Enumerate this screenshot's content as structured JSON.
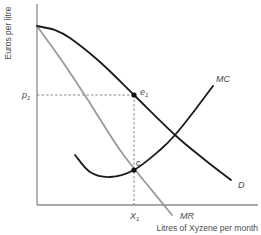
{
  "chart_data": {
    "type": "line",
    "title": "",
    "xlabel": "Litres of Xyzene per month",
    "ylabel": "Euros per litre",
    "grid": false,
    "legend": "none (curve labels placed at line ends)",
    "series": [
      {
        "name": "D",
        "description": "Demand curve (dark, concave then convex, downward sloping)",
        "color": "#1a1a1a",
        "points_px": [
          [
            37,
            26
          ],
          [
            55,
            30
          ],
          [
            70,
            38
          ],
          [
            100,
            62
          ],
          [
            134,
            95
          ],
          [
            175,
            135
          ],
          [
            205,
            160
          ],
          [
            231,
            180
          ]
        ]
      },
      {
        "name": "MR",
        "description": "Marginal revenue curve (grey, steeper downward slope, ends below x-axis)",
        "color": "#9a9a9a",
        "points_px": [
          [
            37,
            26
          ],
          [
            60,
            58
          ],
          [
            86,
            97
          ],
          [
            120,
            150
          ],
          [
            150,
            188
          ],
          [
            172,
            215
          ]
        ]
      },
      {
        "name": "MC",
        "description": "Marginal cost curve (dark, U-shaped)",
        "color": "#1a1a1a",
        "points_px": [
          [
            75,
            155
          ],
          [
            90,
            172
          ],
          [
            110,
            177
          ],
          [
            134,
            170
          ],
          [
            160,
            150
          ],
          [
            175,
            135
          ],
          [
            195,
            110
          ],
          [
            213,
            86
          ]
        ]
      }
    ],
    "points": [
      {
        "name": "e1",
        "label": "e",
        "subscript": "1",
        "px": [
          134,
          95
        ],
        "description": "Intersection of p1 with D at X1"
      },
      {
        "name": "c",
        "label": "c",
        "px": [
          134,
          170
        ],
        "description": "MR = MC intersection"
      }
    ],
    "guides": [
      {
        "type": "horizontal-dashed",
        "from_px": [
          37,
          95
        ],
        "to_px": [
          134,
          95
        ],
        "label": "p1"
      },
      {
        "type": "vertical-dashed",
        "from_px": [
          134,
          95
        ],
        "to_px": [
          134,
          205
        ],
        "label": "X1"
      }
    ],
    "axes_px": {
      "origin": [
        37,
        205
      ],
      "y_top": 4,
      "x_right": 258
    },
    "tick_labels": {
      "y": [
        {
          "label": "p",
          "subscript": "1",
          "px_y": 95
        }
      ],
      "x": [
        {
          "label": "X",
          "subscript": "1",
          "px_x": 134
        }
      ]
    },
    "curve_labels": [
      {
        "text": "D",
        "px": [
          240,
          188
        ]
      },
      {
        "text": "MR",
        "px": [
          180,
          219
        ]
      },
      {
        "text": "MC",
        "px": [
          215,
          82
        ]
      }
    ]
  },
  "labels": {
    "ylabel": "Euros per litre",
    "xlabel": "Litres of Xyzene per month",
    "p1_main": "p",
    "p1_sub": "1",
    "x1_main": "X",
    "x1_sub": "1",
    "e1_main": "e",
    "e1_sub": "1",
    "c": "c",
    "D": "D",
    "MR": "MR",
    "MC": "MC"
  },
  "colors": {
    "axis": "#8a8a8a",
    "dark_curve": "#1a1a1a",
    "mr_curve": "#9a9a9a",
    "dashed": "#7a7a7a",
    "text": "#4a4a4a"
  }
}
